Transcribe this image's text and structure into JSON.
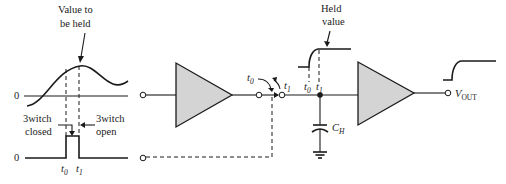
{
  "colors": {
    "ink": "#1a1a1a",
    "amplifier_fill": "#d4d4d4",
    "background": "#ffffff"
  },
  "labels": {
    "value_to_be_held_line1": "Value to",
    "value_to_be_held_line2": "be held",
    "switch_closed_line1": "3witch",
    "switch_closed_line2": "closed",
    "switch_open_line1": "3witch",
    "switch_open_line2": "open",
    "zero_input": "0",
    "zero_control": "0",
    "t0": "t",
    "t0_sub": "0",
    "t1": "t",
    "t1_sub": "1",
    "held_value_line1": "Held",
    "held_value_line2": "value",
    "capacitor": "C",
    "capacitor_sub": "H",
    "output": "V",
    "output_sub": "OUT"
  },
  "components": {
    "input_amplifier": "buffer-amplifier",
    "switch": "analog-switch",
    "hold_capacitor": "C_H",
    "output_amplifier": "buffer-amplifier",
    "ground": "ground-symbol"
  }
}
